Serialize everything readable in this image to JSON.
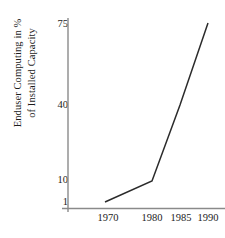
{
  "chart_data": {
    "type": "line",
    "title": "",
    "xlabel": "",
    "ylabel": "Enduser Computing in % of Installed Capacity",
    "ylabel_line1": "Enduser Computing in %",
    "ylabel_line2": "of Installed Capacity",
    "x": [
      1970,
      1980,
      1985,
      1990
    ],
    "values": [
      1,
      10,
      40,
      75
    ],
    "categories": [
      "1970",
      "1980",
      "1985",
      "1990"
    ],
    "series": [
      {
        "name": "Enduser Computing",
        "values": [
          1,
          10,
          40,
          75
        ]
      }
    ],
    "x_tick_labels": [
      "1970",
      "1980",
      "1985",
      "1990"
    ],
    "y_tick_labels": [
      "75",
      "40",
      "10",
      "1"
    ],
    "y_ticks": [
      75,
      40,
      10,
      1
    ],
    "xlim": [
      1966,
      1992
    ],
    "ylim": [
      1,
      75
    ],
    "yscale": "log",
    "grid": false,
    "legend": "none",
    "line_color": "#2b2b2b",
    "axis_color": "#8a8a8a"
  },
  "colors": {
    "background": "#ffffff",
    "text": "#1c1c1c",
    "line": "#2b2b2b",
    "axis": "#8a8a8a"
  }
}
